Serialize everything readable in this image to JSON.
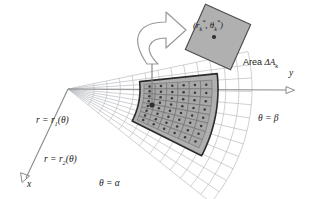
{
  "figure": {
    "labels": {
      "r1": "r = r₁(θ)",
      "r2": "r = r₂(θ)",
      "theta_beta": "θ = β",
      "theta_alpha": "θ = α",
      "axis_y": "y",
      "axis_x": "x",
      "sample_point": "(r*ₖ, θ*ₖ)",
      "area": "Area ΔAₖ"
    },
    "colors": {
      "ink": "#1a1a1a",
      "grid_light": "#b9bcc0",
      "region_fill": "#a9a9a9",
      "cell_fill": "#a8a8a8",
      "cell_stroke": "#6f6f6f",
      "inset_fill": "#b0b0b0",
      "inset_stroke": "#4a4a4a",
      "arrow_fill": "#ffffff",
      "arrow_stroke": "#8e8e8e",
      "dot": "#3a3a3a",
      "axis": "#8a8a8a",
      "background": "#ffffff"
    },
    "geometry": {
      "apex": [
        68,
        89
      ],
      "y_axis_end": [
        288,
        90
      ],
      "x_axis_end": [
        22,
        181
      ],
      "theta_alpha_deg": 27,
      "theta_beta_deg": -6,
      "r_inner": 72,
      "r_outer": 150,
      "radial_divisions": 9,
      "angular_divisions": 8,
      "inset_center": [
        218,
        37
      ],
      "inset_half_diagonal": 35,
      "inset_rotation_deg": 24,
      "sample_dot": [
        214,
        37
      ],
      "grid_dot_anchor": [
        152,
        105
      ]
    }
  }
}
